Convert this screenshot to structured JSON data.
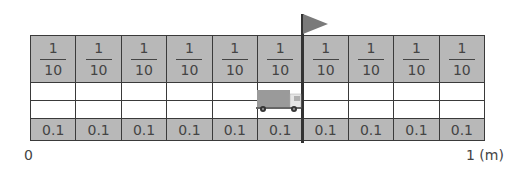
{
  "diagram": {
    "title": "",
    "segments": 10,
    "fraction_row": [
      {
        "numerator": "1",
        "denominator": "10"
      },
      {
        "numerator": "1",
        "denominator": "10"
      },
      {
        "numerator": "1",
        "denominator": "10"
      },
      {
        "numerator": "1",
        "denominator": "10"
      },
      {
        "numerator": "1",
        "denominator": "10"
      },
      {
        "numerator": "1",
        "denominator": "10"
      },
      {
        "numerator": "1",
        "denominator": "10"
      },
      {
        "numerator": "1",
        "denominator": "10"
      },
      {
        "numerator": "1",
        "denominator": "10"
      },
      {
        "numerator": "1",
        "denominator": "10"
      }
    ],
    "decimal_row": [
      "0.1",
      "0.1",
      "0.1",
      "0.1",
      "0.1",
      "0.1",
      "0.1",
      "0.1",
      "0.1",
      "0.1"
    ],
    "axis": {
      "start_label": "0",
      "end_label": "1 (m)"
    },
    "markers": {
      "flag_position_segments": 6,
      "truck_segment": 6
    },
    "colors": {
      "shaded_cell": "#b8b8b8",
      "grid_line": "#3a3a3a",
      "flag": "#7a7a7a"
    }
  }
}
